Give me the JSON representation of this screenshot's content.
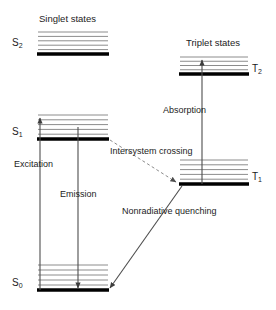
{
  "diagram": {
    "group_labels": {
      "singlet": "Singlet states",
      "triplet": "Triplet states"
    },
    "states": [
      {
        "id": "S2",
        "label": "S",
        "sub": "2",
        "manifold": "singlet",
        "x1": 38,
        "x2": 108,
        "band_top": 32,
        "thick_y": 54,
        "thin_lines": 5,
        "label_x": 12,
        "label_y": 38,
        "label_side": "left"
      },
      {
        "id": "S1",
        "label": "S",
        "sub": "1",
        "manifold": "singlet",
        "x1": 38,
        "x2": 108,
        "band_top": 115,
        "thick_y": 139,
        "thin_lines": 5,
        "label_x": 12,
        "label_y": 127,
        "label_side": "left"
      },
      {
        "id": "S0",
        "label": "S",
        "sub": "0",
        "manifold": "singlet",
        "x1": 38,
        "x2": 108,
        "band_top": 265,
        "thick_y": 290,
        "thin_lines": 5,
        "label_x": 12,
        "label_y": 278,
        "label_side": "left"
      },
      {
        "id": "T2",
        "label": "T",
        "sub": "2",
        "manifold": "triplet",
        "x1": 180,
        "x2": 248,
        "band_top": 57,
        "thick_y": 74,
        "thin_lines": 4,
        "label_x": 252,
        "label_y": 64,
        "label_side": "right"
      },
      {
        "id": "T1",
        "label": "T",
        "sub": "1",
        "manifold": "triplet",
        "x1": 180,
        "x2": 248,
        "band_top": 160,
        "thick_y": 184,
        "thin_lines": 5,
        "label_x": 252,
        "label_y": 172,
        "label_side": "right"
      }
    ],
    "processes": [
      {
        "id": "excitation",
        "label": "Excitation",
        "style": "solid-arrow",
        "from": "S0",
        "to": "S1",
        "x": 40,
        "y_start": 290,
        "y_end": 118,
        "direction": "up",
        "label_x": 14,
        "label_y": 160
      },
      {
        "id": "emission",
        "label": "Emission",
        "style": "solid-arrow",
        "from": "S1",
        "to": "S0",
        "x": 78,
        "y_start": 127,
        "y_end": 288,
        "direction": "down",
        "label_x": 60,
        "label_y": 190
      },
      {
        "id": "absorption",
        "label": "Absorption",
        "style": "solid-arrow",
        "from": "T1",
        "to": "T2",
        "x": 202,
        "y_start": 184,
        "y_end": 60,
        "direction": "up",
        "label_x": 163,
        "label_y": 106
      },
      {
        "id": "intersystem-crossing",
        "label": "Intersystem crossing",
        "style": "dashed-arrow",
        "from": "S1",
        "to": "T1",
        "x_start": 110,
        "y_start": 140,
        "x_end": 176,
        "y_end": 182,
        "label_x": 110,
        "label_y": 146
      },
      {
        "id": "nonradiative-quenching",
        "label": "Nonradiative quenching",
        "style": "solid-arrow",
        "from": "T1",
        "to": "S0",
        "x_start": 182,
        "y_start": 186,
        "x_end": 110,
        "y_end": 288,
        "label_x": 126,
        "label_y": 206
      }
    ],
    "colors": {
      "thick_level": "#000000",
      "thin_level": "#8c8c8c",
      "arrow": "#4d4d4d",
      "dashed_arrow": "#8c8c8c",
      "text": "#1c1c1c",
      "background": "#ffffff"
    }
  }
}
